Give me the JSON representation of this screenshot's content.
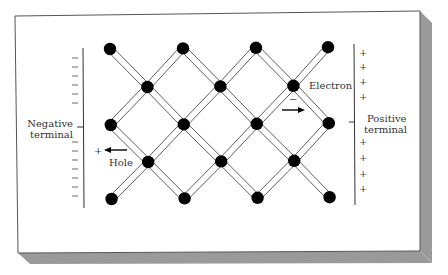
{
  "figure": {
    "type": "semiconductor-lattice-diagram",
    "colors": {
      "card_border": "#555555",
      "shadow": "#9a9a9a",
      "atom": "#000000",
      "bond": "#333333"
    },
    "labels": {
      "negative_terminal_line1": "Negative",
      "negative_terminal_line2": "terminal",
      "positive_terminal_line1": "Positive",
      "positive_terminal_line2": "terminal",
      "electron": "Electron",
      "electron_charge": "−",
      "hole": "Hole",
      "hole_charge": "+"
    },
    "negative_terminal": {
      "sign": "−",
      "top_count": 6,
      "bottom_count": 7
    },
    "positive_terminal": {
      "sign": "+",
      "top_count": 4,
      "bottom_count": 4
    },
    "lattice": {
      "rows": 5,
      "atoms_per_outer_row": 4,
      "atoms_per_inner_row": 3
    },
    "arrows": {
      "electron_direction": "right",
      "hole_direction": "left"
    }
  }
}
